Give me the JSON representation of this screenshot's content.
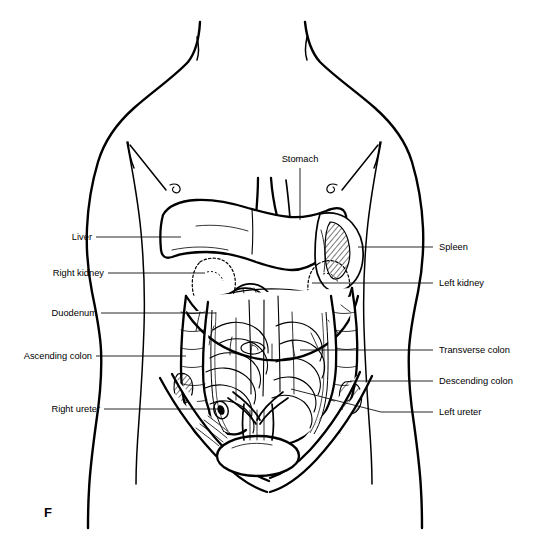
{
  "figure": {
    "marker": "F",
    "view": "anterior",
    "style": "black-and-white line drawing"
  },
  "labels": {
    "left": [
      {
        "id": "liver",
        "text": "Liver"
      },
      {
        "id": "right-kidney",
        "text": "Right kidney"
      },
      {
        "id": "duodenum",
        "text": "Duodenum"
      },
      {
        "id": "ascending-colon",
        "text": "Ascending colon"
      },
      {
        "id": "right-ureter",
        "text": "Right ureter"
      }
    ],
    "top": [
      {
        "id": "stomach",
        "text": "Stomach"
      }
    ],
    "right": [
      {
        "id": "spleen",
        "text": "Spleen"
      },
      {
        "id": "left-kidney",
        "text": "Left kidney"
      },
      {
        "id": "transverse-colon",
        "text": "Transverse colon"
      },
      {
        "id": "descending-colon",
        "text": "Descending colon"
      },
      {
        "id": "left-ureter",
        "text": "Left ureter"
      }
    ]
  },
  "colors": {
    "background": "#ffffff",
    "ink": "#000000",
    "leader": "#000000"
  }
}
